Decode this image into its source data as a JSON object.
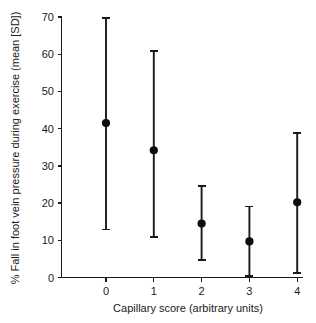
{
  "chart_data": {
    "type": "scatter",
    "title": "",
    "xlabel": "Capillary score (arbitrary units)",
    "ylabel": "% Fall in foot vein pressure during exercise (mean [SD])",
    "xlim": [
      -0.55,
      4.45
    ],
    "ylim": [
      0,
      70
    ],
    "grid": false,
    "legend": null,
    "xticks": [
      0,
      1,
      2,
      3,
      4
    ],
    "xtick_labels": [
      "0",
      "1",
      "2",
      "3",
      "4"
    ],
    "yticks": [
      0,
      10,
      20,
      30,
      40,
      50,
      60,
      70
    ],
    "ytick_labels": [
      "0",
      "10",
      "20",
      "30",
      "40",
      "50",
      "60",
      "70"
    ],
    "error_type": "SD",
    "marker": "filled-circle",
    "categories": [
      "0",
      "1",
      "2",
      "3",
      "4"
    ],
    "x": [
      0,
      1,
      2,
      3,
      4
    ],
    "values": [
      41.5,
      34.2,
      14.5,
      9.7,
      20.2
    ],
    "error_low": [
      12.9,
      10.8,
      4.6,
      0.3,
      1.3
    ],
    "error_high": [
      69.7,
      60.8,
      24.5,
      19.1,
      38.8
    ],
    "points": [
      {
        "x": 0,
        "mean": 41.5,
        "low": 12.9,
        "high": 69.7
      },
      {
        "x": 1,
        "mean": 34.2,
        "low": 10.8,
        "high": 60.8
      },
      {
        "x": 2,
        "mean": 14.5,
        "low": 4.6,
        "high": 24.5
      },
      {
        "x": 3,
        "mean": 9.7,
        "low": 0.3,
        "high": 19.1
      },
      {
        "x": 4,
        "mean": 20.2,
        "low": 1.3,
        "high": 38.8
      }
    ],
    "colors": {
      "marker": "#0d0d0d",
      "errorbar": "#1a1a1a",
      "axis": "#1a1a1a",
      "background": "#ffffff"
    }
  }
}
